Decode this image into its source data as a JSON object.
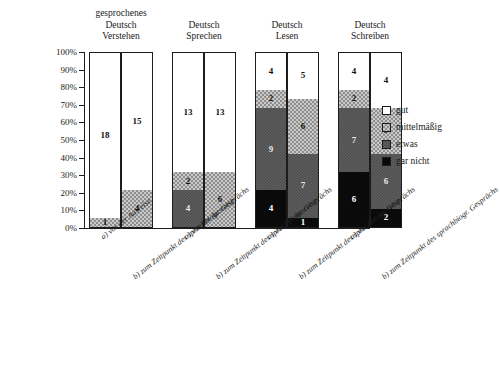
{
  "chart_data": {
    "type": "bar",
    "subtype": "100% stacked column",
    "title": "",
    "xlabel": "",
    "ylabel": "",
    "ylim": [
      0,
      100
    ],
    "y_tick_labels": [
      "100%",
      "90%",
      "80%",
      "70%",
      "60%",
      "50%",
      "40%",
      "30%",
      "20%",
      "10%",
      "0%"
    ],
    "y_tick_values": [
      100,
      90,
      80,
      70,
      60,
      50,
      40,
      30,
      20,
      10,
      0
    ],
    "grid": false,
    "legend_position": "right",
    "value_unit": "count (n=19 per bar)",
    "legend": [
      {
        "label": "gut",
        "color": "#ffffff",
        "pattern": "solid-white"
      },
      {
        "label": "mittelmäßig",
        "color": "#c9c9c9",
        "pattern": "light-checker"
      },
      {
        "label": "etwas",
        "color": "#5e5e5e",
        "pattern": "dark-checker"
      },
      {
        "label": "gar nicht",
        "color": "#0a0a0a",
        "pattern": "solid-black"
      }
    ],
    "series": [
      {
        "name": "gar nicht",
        "values": [
          0,
          0,
          0,
          0,
          4,
          1,
          6,
          2
        ]
      },
      {
        "name": "etwas",
        "values": [
          0,
          0,
          4,
          0,
          9,
          7,
          7,
          6
        ]
      },
      {
        "name": "mittelmäßig",
        "values": [
          1,
          4,
          2,
          6,
          2,
          6,
          2,
          5
        ]
      },
      {
        "name": "gut",
        "values": [
          18,
          15,
          13,
          13,
          4,
          5,
          4,
          4
        ]
      }
    ],
    "categories": [
      "gesprochenes Deutsch Verstehen — a) vor der Ausreise",
      "gesprochenes Deutsch Verstehen — b) zum Zeitpunkt des sprachbiogr. Gesprächs",
      "Deutsch Sprechen — a) vor der Ausreise",
      "Deutsch Sprechen — b) zum Zeitpunkt des sprachbiogr. Gesprächs",
      "Deutsch Lesen — a) vor der Ausreise",
      "Deutsch Lesen — b) zum Zeitpunkt des sprachbiogr. Gesprächs",
      "Deutsch Schreiben — a) vor der Ausreise",
      "Deutsch Schreiben — b) zum Zeitpunkt des sprachbiogr. Gesprächs"
    ],
    "groups": [
      {
        "header": "gesprochenes\nDeutsch\nVerstehen",
        "bars": [
          {
            "xlabel": "a) vor der Ausreise",
            "segments": [
              {
                "key": "garnicht",
                "value": 0,
                "label": "",
                "percent": 0
              },
              {
                "key": "etwas",
                "value": 0,
                "label": "",
                "percent": 0
              },
              {
                "key": "mittel",
                "value": 1,
                "label": "1",
                "percent": 5.3
              },
              {
                "key": "gut",
                "value": 18,
                "label": "18",
                "percent": 94.7
              }
            ]
          },
          {
            "xlabel": "b) zum Zeitpunkt des sprachbiogr. Gesprächs",
            "segments": [
              {
                "key": "garnicht",
                "value": 0,
                "label": "",
                "percent": 0
              },
              {
                "key": "etwas",
                "value": 0,
                "label": "",
                "percent": 0
              },
              {
                "key": "mittel",
                "value": 4,
                "label": "4",
                "percent": 21.1
              },
              {
                "key": "gut",
                "value": 15,
                "label": "15",
                "percent": 78.9
              }
            ]
          }
        ]
      },
      {
        "header": "Deutsch\nSprechen",
        "bars": [
          {
            "xlabel": "a) vor der Ausreise",
            "segments": [
              {
                "key": "garnicht",
                "value": 0,
                "label": "",
                "percent": 0
              },
              {
                "key": "etwas",
                "value": 4,
                "label": "4",
                "percent": 21.1
              },
              {
                "key": "mittel",
                "value": 2,
                "label": "2",
                "percent": 10.5
              },
              {
                "key": "gut",
                "value": 13,
                "label": "13",
                "percent": 68.4
              }
            ]
          },
          {
            "xlabel": "b) zum Zeitpunkt des sprachbiogr. Gesprächs",
            "segments": [
              {
                "key": "garnicht",
                "value": 0,
                "label": "",
                "percent": 0
              },
              {
                "key": "etwas",
                "value": 0,
                "label": "",
                "percent": 0
              },
              {
                "key": "mittel",
                "value": 6,
                "label": "6",
                "percent": 31.6
              },
              {
                "key": "gut",
                "value": 13,
                "label": "13",
                "percent": 68.4
              }
            ]
          }
        ]
      },
      {
        "header": "Deutsch\nLesen",
        "bars": [
          {
            "xlabel": "a) vor der Ausreise",
            "segments": [
              {
                "key": "garnicht",
                "value": 4,
                "label": "4",
                "percent": 21.1
              },
              {
                "key": "etwas",
                "value": 9,
                "label": "9",
                "percent": 47.4
              },
              {
                "key": "mittel",
                "value": 2,
                "label": "2",
                "percent": 10.5
              },
              {
                "key": "gut",
                "value": 4,
                "label": "4",
                "percent": 21.0
              }
            ]
          },
          {
            "xlabel": "b) zum Zeitpunkt des sprachbiogr. Gesprächs",
            "segments": [
              {
                "key": "garnicht",
                "value": 1,
                "label": "1",
                "percent": 5.3
              },
              {
                "key": "etwas",
                "value": 7,
                "label": "7",
                "percent": 36.8
              },
              {
                "key": "mittel",
                "value": 6,
                "label": "6",
                "percent": 31.6
              },
              {
                "key": "gut",
                "value": 5,
                "label": "5",
                "percent": 26.3
              }
            ]
          }
        ]
      },
      {
        "header": "Deutsch\nSchreiben",
        "bars": [
          {
            "xlabel": "a) vor der Ausreise",
            "segments": [
              {
                "key": "garnicht",
                "value": 6,
                "label": "6",
                "percent": 31.6
              },
              {
                "key": "etwas",
                "value": 7,
                "label": "7",
                "percent": 36.8
              },
              {
                "key": "mittel",
                "value": 2,
                "label": "2",
                "percent": 10.5
              },
              {
                "key": "gut",
                "value": 4,
                "label": "4",
                "percent": 21.1
              }
            ]
          },
          {
            "xlabel": "b) zum Zeitpunkt des sprachbiogr. Gesprächs",
            "segments": [
              {
                "key": "garnicht",
                "value": 2,
                "label": "2",
                "percent": 10.5
              },
              {
                "key": "etwas",
                "value": 6,
                "label": "6",
                "percent": 31.6
              },
              {
                "key": "mittel",
                "value": 5,
                "label": "5",
                "percent": 26.3
              },
              {
                "key": "gut",
                "value": 4,
                "label": "4",
                "percent": 31.6
              }
            ]
          }
        ]
      }
    ]
  }
}
